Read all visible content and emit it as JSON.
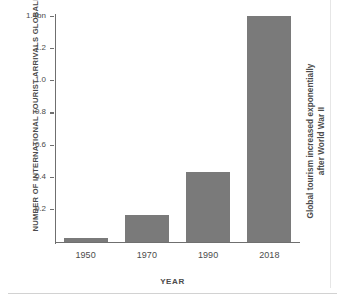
{
  "chart_data": {
    "type": "bar",
    "title": "",
    "xlabel": "YEAR",
    "ylabel": "NUMBER OF INTERNATIONAL TOURIST ARRIVALS GLOBALLY",
    "categories": [
      "1950",
      "1970",
      "1990",
      "2018"
    ],
    "values": [
      0.025,
      0.166,
      0.435,
      1.4
    ],
    "ylim": [
      0,
      1.4
    ],
    "ytick_values": [
      0.2,
      0.4,
      0.6,
      0.8,
      1.0,
      1.2,
      1.4
    ],
    "ytick_labels": [
      "0.2",
      "0.4",
      "0.6",
      "0.8",
      "1.0",
      "1.2",
      "1.4bn"
    ],
    "grid": false,
    "legend": null,
    "annotations": [
      {
        "name": "right-side-note",
        "line1": "Global tourism increased exponentially",
        "line2": "after World War II",
        "position": "right-outside-vertical"
      }
    ],
    "colors": {
      "bar": "#7a7a7a",
      "axis": "#6f6f6f",
      "text": "#4b4b4b",
      "background": "#ffffff",
      "rule": "#d2d2d2"
    }
  }
}
